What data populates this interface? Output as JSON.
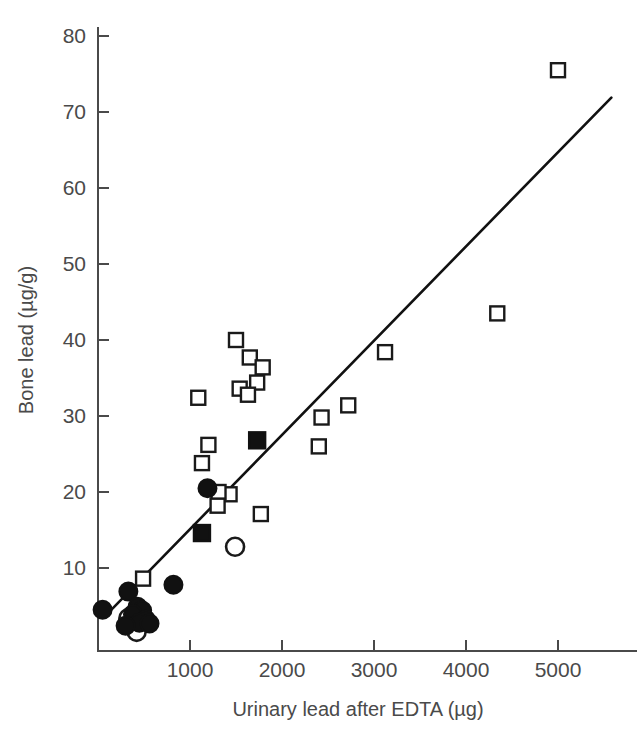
{
  "chart_data": {
    "type": "scatter",
    "title": "",
    "xlabel": "Urinary lead after EDTA (µg)",
    "ylabel": "Bone lead (µg/g)",
    "xlim": [
      0,
      5250
    ],
    "ylim": [
      0.8,
      82
    ],
    "xticks": [
      1000,
      2000,
      3000,
      4000,
      5000
    ],
    "xtick_labels": [
      "1000",
      "2000",
      "3000",
      "4000",
      "5000"
    ],
    "yticks": [
      10,
      20,
      30,
      40,
      50,
      60,
      70,
      80
    ],
    "ytick_labels": [
      "10",
      "20",
      "30",
      "40",
      "50",
      "60",
      "70",
      "80"
    ],
    "grid": false,
    "legend": "none",
    "marker_color": "#111111",
    "line_color": "#111111",
    "trend_line": {
      "name": "regression line",
      "x_start": 120,
      "y_start": 4.2,
      "x_end": 5580,
      "y_end": 71.9
    },
    "series": [
      {
        "name": "open-square",
        "marker": "open square",
        "points": [
          [
            5000,
            75.5
          ],
          [
            4340,
            43.5
          ],
          [
            3120,
            38.4
          ],
          [
            2720,
            31.4
          ],
          [
            2430,
            29.8
          ],
          [
            2400,
            26.0
          ],
          [
            1500,
            40.0
          ],
          [
            1650,
            37.7
          ],
          [
            1790,
            36.4
          ],
          [
            1730,
            34.4
          ],
          [
            1540,
            33.6
          ],
          [
            1630,
            32.8
          ],
          [
            1090,
            32.4
          ],
          [
            1200,
            26.2
          ],
          [
            1130,
            23.8
          ],
          [
            1430,
            19.7
          ],
          [
            1770,
            17.1
          ],
          [
            1310,
            20.0
          ],
          [
            1300,
            18.2
          ],
          [
            490,
            8.6
          ]
        ]
      },
      {
        "name": "filled-square",
        "marker": "filled square",
        "points": [
          [
            1730,
            26.8
          ],
          [
            1130,
            14.6
          ]
        ]
      },
      {
        "name": "open-circle",
        "marker": "open circle",
        "points": [
          [
            1490,
            12.8
          ],
          [
            360,
            2.6
          ],
          [
            420,
            1.6
          ],
          [
            330,
            3.4
          ]
        ]
      },
      {
        "name": "filled-circle",
        "marker": "filled circle",
        "points": [
          [
            1190,
            20.5
          ],
          [
            820,
            7.8
          ],
          [
            330,
            6.9
          ],
          [
            50,
            4.5
          ],
          [
            430,
            4.9
          ],
          [
            480,
            4.4
          ],
          [
            380,
            3.9
          ],
          [
            520,
            3.2
          ],
          [
            450,
            2.8
          ],
          [
            300,
            2.4
          ],
          [
            560,
            2.7
          ]
        ]
      }
    ]
  },
  "axes": {
    "x_title": "Urinary lead after EDTA (µg)",
    "y_title": "Bone lead (µg/g)"
  }
}
